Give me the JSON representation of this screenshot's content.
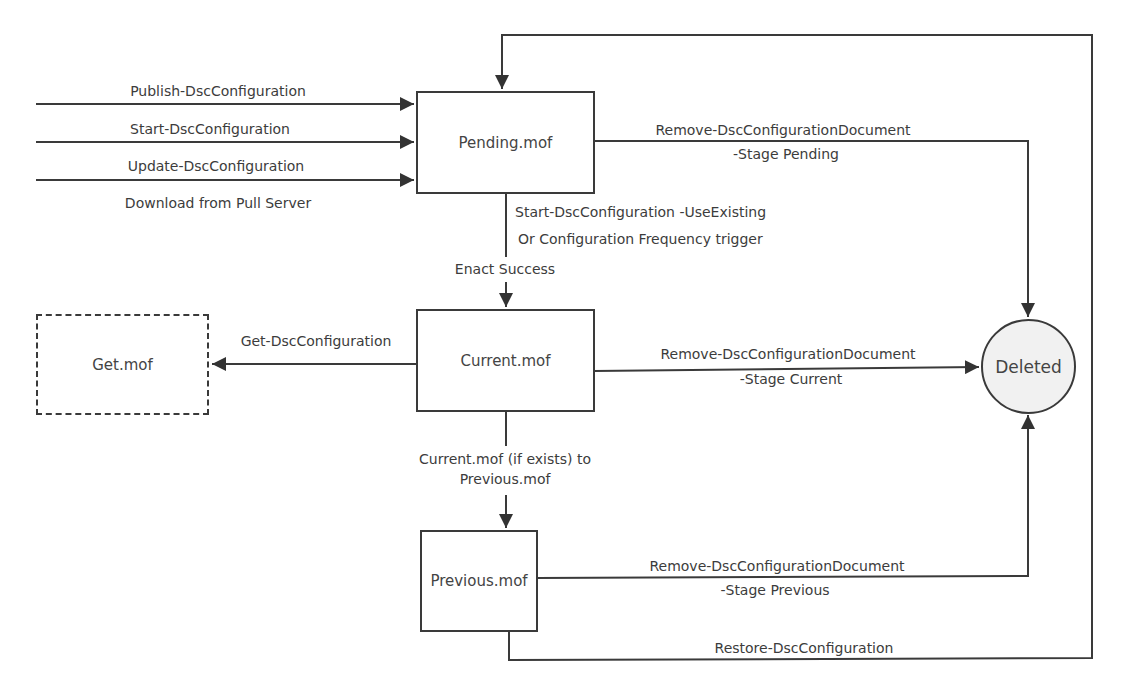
{
  "diagram": {
    "type": "state-flow",
    "nodes": {
      "pending": {
        "label": "Pending.mof"
      },
      "current": {
        "label": "Current.mof"
      },
      "previous": {
        "label": "Previous.mof"
      },
      "get": {
        "label": "Get.mof",
        "style": "dashed"
      },
      "deleted": {
        "label": "Deleted",
        "shape": "circle"
      }
    },
    "inputs": [
      {
        "label": "Publish-DscConfiguration"
      },
      {
        "label": "Start-DscConfiguration"
      },
      {
        "label": "Update-DscConfiguration"
      },
      {
        "label": "Download from Pull Server"
      }
    ],
    "edges": {
      "pending_to_current": {
        "line1": "Start-DscConfiguration -UseExisting",
        "line2": "Or Configuration Frequency trigger",
        "line3": "Enact Success"
      },
      "current_to_get": {
        "label": "Get-DscConfiguration"
      },
      "current_to_previous": {
        "line1": "Current.mof (if exists) to",
        "line2": "Previous.mof"
      },
      "pending_to_deleted": {
        "line1": "Remove-DscConfigurationDocument",
        "line2": "-Stage Pending"
      },
      "current_to_deleted": {
        "line1": "Remove-DscConfigurationDocument",
        "line2": "-Stage Current"
      },
      "previous_to_deleted": {
        "line1": "Remove-DscConfigurationDocument",
        "line2": "-Stage Previous"
      },
      "previous_to_pending": {
        "label": "Restore-DscConfiguration"
      }
    },
    "colors": {
      "stroke": "#3a3a3a",
      "text": "#3c3c3c",
      "deleted_fill": "#f1f1f1"
    }
  }
}
